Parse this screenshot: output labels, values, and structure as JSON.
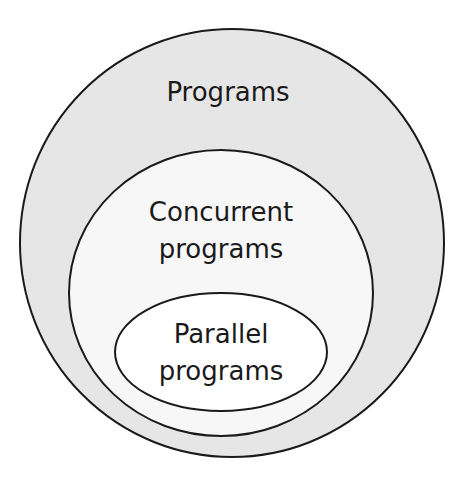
{
  "diagram": {
    "type": "nested-sets",
    "colors": {
      "outer_fill": "#e6e6e6",
      "middle_fill": "#f7f7f7",
      "inner_fill": "#ffffff",
      "stroke": "#1a1a1a"
    },
    "sets": [
      {
        "id": "programs",
        "label": "Programs",
        "lines": [
          "Programs"
        ]
      },
      {
        "id": "concurrent",
        "label": "Concurrent programs",
        "lines": [
          "Concurrent",
          "programs"
        ]
      },
      {
        "id": "parallel",
        "label": "Parallel programs",
        "lines": [
          "Parallel",
          "programs"
        ]
      }
    ]
  }
}
